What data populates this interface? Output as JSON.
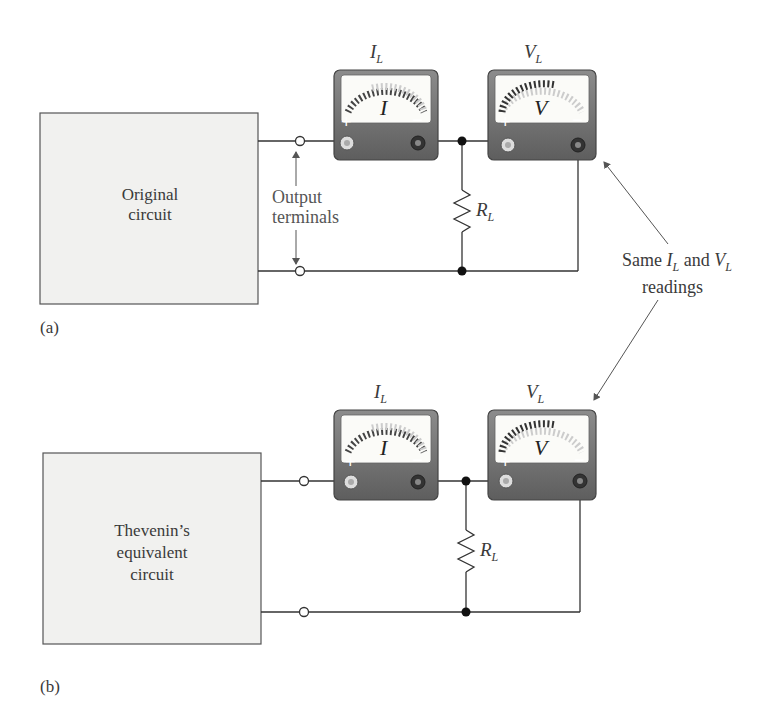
{
  "figure": {
    "panel_a": {
      "label": "(a)",
      "box_text_line1": "Original",
      "box_text_line2": "circuit",
      "ammeter_label": "I",
      "ammeter_label_sub": "L",
      "voltmeter_label": "V",
      "voltmeter_label_sub": "L",
      "ammeter_face": "I",
      "voltmeter_face": "V",
      "resistor_label": "R",
      "resistor_label_sub": "L",
      "terminals_line1": "Output",
      "terminals_line2": "terminals",
      "plus": "+",
      "minus": "−"
    },
    "panel_b": {
      "label": "(b)",
      "box_text_line1": "Thevenin’s",
      "box_text_line2": "equivalent",
      "box_text_line3": "circuit",
      "ammeter_label": "I",
      "ammeter_label_sub": "L",
      "voltmeter_label": "V",
      "voltmeter_label_sub": "L",
      "ammeter_face": "I",
      "voltmeter_face": "V",
      "resistor_label": "R",
      "resistor_label_sub": "L",
      "plus": "+",
      "minus": "−"
    },
    "annotation": {
      "line1_pre": "Same ",
      "line1_I": "I",
      "line1_I_sub": "L",
      "line1_mid": " and ",
      "line1_V": "V",
      "line1_V_sub": "L",
      "line2": "readings"
    },
    "colors": {
      "box_fill": "#f1f1ef",
      "meter_body": "#6f6f6f",
      "meter_face": "#fbfbf8",
      "wire": "#333333"
    }
  }
}
